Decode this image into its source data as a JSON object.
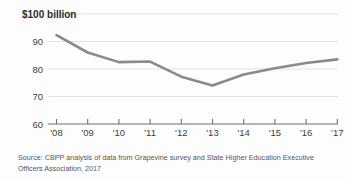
{
  "chart_data": {
    "type": "line",
    "title": "",
    "subtitle": "",
    "unit_label": "$100 billion",
    "xlabel": "",
    "ylabel": "",
    "categories": [
      "'08",
      "'09",
      "'10",
      "'11",
      "'12",
      "'13",
      "'14",
      "'15",
      "'16",
      "'17"
    ],
    "x": [
      2008,
      2009,
      2010,
      2011,
      2012,
      2013,
      2014,
      2015,
      2016,
      2017
    ],
    "series": [
      {
        "name": "State higher education funding",
        "values": [
          92.3,
          86.0,
          82.5,
          82.7,
          77.2,
          74.0,
          78.0,
          80.3,
          82.2,
          83.5
        ]
      }
    ],
    "ylim": [
      60,
      100
    ],
    "yticks": [
      60,
      70,
      80,
      90,
      100
    ],
    "ytick_labels": [
      "60",
      "70",
      "80",
      "90",
      "$100 billion"
    ],
    "xlim": [
      2008,
      2017
    ],
    "grid": true,
    "grid_axis": "y",
    "legend": false,
    "legend_position": "none",
    "line_color": "#8a8a8a",
    "grid_color": "#e2e2e2",
    "axis_color": "#6f6f6f"
  },
  "source": {
    "line1": "Source: CBPP analysis of data from Grapevine survey and State Higher Education Executive",
    "line2": "Officers Association, 2017"
  }
}
